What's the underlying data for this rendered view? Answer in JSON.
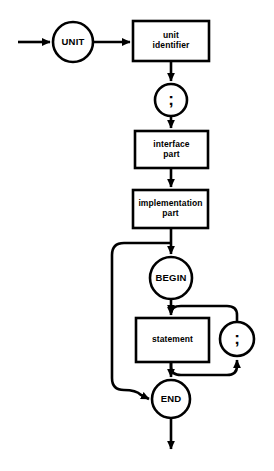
{
  "diagram": {
    "title": "UNIT",
    "type": "railroad-syntax-diagram",
    "stroke_color": "#000000",
    "background_color": "#ffffff",
    "nodes": [
      {
        "id": "unit",
        "kind": "terminal-circle",
        "label": "UNIT",
        "cx": 73,
        "cy": 42,
        "r": 20
      },
      {
        "id": "unit-identifier",
        "kind": "nonterminal-box",
        "label": "unit\nidentifier",
        "x": 133,
        "y": 21,
        "w": 76,
        "h": 40
      },
      {
        "id": "semicolon-1",
        "kind": "terminal-circle",
        "label": ";",
        "cx": 171,
        "cy": 100,
        "r": 16
      },
      {
        "id": "interface-part",
        "kind": "nonterminal-box",
        "label": "interface\npart",
        "x": 135,
        "y": 131,
        "w": 73,
        "h": 37
      },
      {
        "id": "implementation-part",
        "kind": "nonterminal-box",
        "label": "implementation\npart",
        "x": 133,
        "y": 190,
        "w": 75,
        "h": 38
      },
      {
        "id": "begin",
        "kind": "terminal-circle",
        "label": "BEGIN",
        "cx": 171,
        "cy": 278,
        "r": 21
      },
      {
        "id": "statement",
        "kind": "nonterminal-box",
        "label": "statement",
        "x": 136,
        "y": 318,
        "w": 73,
        "h": 44
      },
      {
        "id": "semicolon-2",
        "kind": "terminal-circle",
        "label": ";",
        "cx": 237,
        "cy": 339,
        "r": 17
      },
      {
        "id": "end",
        "kind": "terminal-circle",
        "label": "END",
        "cx": 171,
        "cy": 399,
        "r": 19
      }
    ],
    "entry": {
      "x_start": 18,
      "x_end": 53,
      "y": 42
    },
    "exit": {
      "x": 171,
      "y_start": 418,
      "y_end": 452
    },
    "labels": {
      "unit": "UNIT",
      "unit_identifier": "unit\nidentifier",
      "semicolon_1": ";",
      "interface_part": "interface\npart",
      "implementation_part": "implementation\npart",
      "begin": "BEGIN",
      "statement": "statement",
      "semicolon_2": ";",
      "end": "END"
    }
  }
}
